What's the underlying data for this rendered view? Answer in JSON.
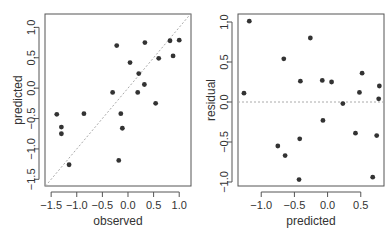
{
  "chart_data": [
    {
      "type": "scatter",
      "title": "",
      "xlabel": "observed",
      "ylabel": "predicted",
      "xlim": [
        -1.62,
        1.23
      ],
      "ylim": [
        -1.61,
        1.22
      ],
      "xticks": [
        -1.5,
        -1.0,
        -0.5,
        0.0,
        0.5,
        1.0
      ],
      "yticks": [
        -1.5,
        -1.0,
        -0.5,
        0.0,
        0.5,
        1.0
      ],
      "xtick_labels": [
        "−1.5",
        "−1.0",
        "−0.5",
        "0.0",
        "0.5",
        "1.0"
      ],
      "ytick_labels": [
        "−1.5",
        "−1.0",
        "−0.5",
        "0.0",
        "0.5",
        "1.0"
      ],
      "reference_line": {
        "type": "identity",
        "style": "dotted",
        "color": "#aaaaaa"
      },
      "points": [
        {
          "x": -1.39,
          "y": -0.43
        },
        {
          "x": -1.3,
          "y": -0.64
        },
        {
          "x": -1.3,
          "y": -0.75
        },
        {
          "x": -1.15,
          "y": -1.26
        },
        {
          "x": -0.86,
          "y": -0.42
        },
        {
          "x": -0.3,
          "y": -0.07
        },
        {
          "x": -0.22,
          "y": 0.7
        },
        {
          "x": -0.18,
          "y": -1.19
        },
        {
          "x": -0.14,
          "y": -0.42
        },
        {
          "x": -0.11,
          "y": -0.66
        },
        {
          "x": 0.04,
          "y": 0.42
        },
        {
          "x": 0.19,
          "y": -0.07
        },
        {
          "x": 0.21,
          "y": 0.24
        },
        {
          "x": 0.32,
          "y": 0.06
        },
        {
          "x": 0.33,
          "y": 0.75
        },
        {
          "x": 0.54,
          "y": -0.25
        },
        {
          "x": 0.6,
          "y": 0.49
        },
        {
          "x": 0.82,
          "y": 0.78
        },
        {
          "x": 0.88,
          "y": 0.53
        },
        {
          "x": 1.0,
          "y": 0.79
        }
      ],
      "grid": false,
      "point_color": "#333333"
    },
    {
      "type": "scatter",
      "title": "",
      "xlabel": "predicted",
      "ylabel": "residual",
      "xlim": [
        -1.35,
        0.85
      ],
      "ylim": [
        -1.05,
        1.1
      ],
      "xticks": [
        -1.0,
        -0.5,
        0.0,
        0.5
      ],
      "yticks": [
        -1.0,
        -0.5,
        0.0,
        0.5,
        1.0
      ],
      "xtick_labels": [
        "−1.0",
        "−0.5",
        "0.0",
        "0.5"
      ],
      "ytick_labels": [
        "−1.0",
        "−0.5",
        "0.0",
        "0.5",
        "1.0"
      ],
      "reference_line": {
        "type": "horizontal",
        "y": 0,
        "style": "dashed",
        "color": "#aaaaaa"
      },
      "points": [
        {
          "x": -1.26,
          "y": 0.11
        },
        {
          "x": -1.18,
          "y": 1.01
        },
        {
          "x": -0.75,
          "y": -0.55
        },
        {
          "x": -0.66,
          "y": 0.54
        },
        {
          "x": -0.64,
          "y": -0.67
        },
        {
          "x": -0.43,
          "y": -0.97
        },
        {
          "x": -0.42,
          "y": -0.46
        },
        {
          "x": -0.41,
          "y": 0.26
        },
        {
          "x": -0.26,
          "y": 0.8
        },
        {
          "x": -0.08,
          "y": 0.27
        },
        {
          "x": -0.07,
          "y": -0.23
        },
        {
          "x": 0.06,
          "y": 0.25
        },
        {
          "x": 0.23,
          "y": -0.02
        },
        {
          "x": 0.42,
          "y": -0.39
        },
        {
          "x": 0.48,
          "y": 0.12
        },
        {
          "x": 0.52,
          "y": 0.36
        },
        {
          "x": 0.68,
          "y": -0.94
        },
        {
          "x": 0.74,
          "y": -0.42
        },
        {
          "x": 0.77,
          "y": 0.04
        },
        {
          "x": 0.78,
          "y": 0.2
        }
      ],
      "grid": false,
      "point_color": "#333333"
    }
  ]
}
